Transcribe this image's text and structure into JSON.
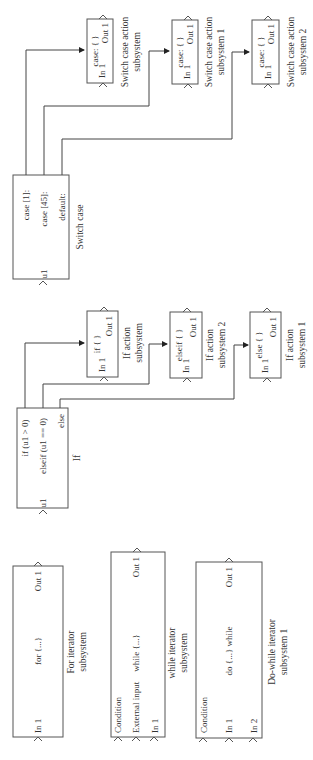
{
  "diagram": {
    "type": "simulink-subsystems",
    "orientation": "rotated-90-ccw",
    "switch_case": {
      "block_label": "Switch case",
      "input_port": "u1",
      "cases": [
        "case [1]:",
        "case [45]:",
        "default:"
      ],
      "action_subsystems": [
        {
          "title": "case: { }",
          "in": "In 1",
          "out": "Out 1",
          "label_line1": "Switch case action",
          "label_line2": "subsystem"
        },
        {
          "title": "case: { }",
          "in": "In 1",
          "out": "Out 1",
          "label_line1": "Switch case action",
          "label_line2": "subsystem 1"
        },
        {
          "title": "case: { }",
          "in": "In 1",
          "out": "Out 1",
          "label_line1": "Switch case action",
          "label_line2": "subsystem 2"
        }
      ]
    },
    "if_block": {
      "block_label": "If",
      "input_port": "u1",
      "conditions": [
        "if (u1 > 0)",
        "elseif (u1 == 0)",
        "else"
      ],
      "action_subsystems": [
        {
          "title": "if { }",
          "in": "In 1",
          "out": "Out 1",
          "label_line1": "If action",
          "label_line2": "subsystem"
        },
        {
          "title": "elseif { }",
          "in": "In 1",
          "out": "Out 1",
          "label_line1": "If action",
          "label_line2": "subsystem 2"
        },
        {
          "title": "else { }",
          "in": "In 1",
          "out": "Out 1",
          "label_line1": "If action",
          "label_line2": "subsystem 1"
        }
      ]
    },
    "iterators": [
      {
        "body": "for {...}",
        "inputs": [
          "In 1"
        ],
        "out": "Out 1",
        "label_line1": "For iterator",
        "label_line2": "subsystem"
      },
      {
        "body": "while {...}",
        "inputs": [
          "Condition",
          "External input",
          "In 1"
        ],
        "out": "Out 1",
        "label_line1": "while iterator",
        "label_line2": "subsystem"
      },
      {
        "body": "do {...} while",
        "inputs": [
          "Condition",
          "In 1",
          "In 2"
        ],
        "out": "Out 1",
        "label_line1": "Do-while iterator",
        "label_line2": "subsystem 1"
      }
    ]
  }
}
